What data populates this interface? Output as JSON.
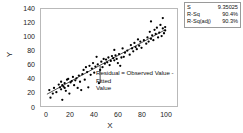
{
  "chart_data": {
    "type": "scatter",
    "title": "",
    "xlabel": "X",
    "ylabel": "Y",
    "xlim": [
      -5,
      110
    ],
    "ylim": [
      0,
      140
    ],
    "xticks": [
      0,
      20,
      40,
      60,
      80,
      100
    ],
    "yticks": [
      0,
      20,
      40,
      60,
      80,
      100,
      120,
      140
    ],
    "grid": false,
    "legend_position": "none",
    "series": [
      {
        "name": "Observed Values",
        "type": "scatter",
        "marker": "filled-circle",
        "color": "#000000",
        "points": [
          [
            2,
            23
          ],
          [
            3,
            12
          ],
          [
            5,
            18
          ],
          [
            6,
            26
          ],
          [
            8,
            20
          ],
          [
            10,
            31
          ],
          [
            11,
            27
          ],
          [
            12,
            24
          ],
          [
            12,
            35
          ],
          [
            13,
            30
          ],
          [
            13,
            9
          ],
          [
            14,
            28
          ],
          [
            15,
            33
          ],
          [
            15,
            26
          ],
          [
            16,
            22
          ],
          [
            17,
            38
          ],
          [
            18,
            39
          ],
          [
            18,
            29
          ],
          [
            19,
            18
          ],
          [
            20,
            34
          ],
          [
            21,
            36
          ],
          [
            22,
            42
          ],
          [
            23,
            30
          ],
          [
            24,
            37
          ],
          [
            25,
            40
          ],
          [
            26,
            26
          ],
          [
            27,
            44
          ],
          [
            28,
            35
          ],
          [
            29,
            23
          ],
          [
            30,
            46
          ],
          [
            31,
            52
          ],
          [
            32,
            38
          ],
          [
            33,
            56
          ],
          [
            34,
            49
          ],
          [
            35,
            27
          ],
          [
            36,
            58
          ],
          [
            37,
            45
          ],
          [
            38,
            54
          ],
          [
            39,
            62
          ],
          [
            40,
            48
          ],
          [
            41,
            57
          ],
          [
            42,
            71
          ],
          [
            43,
            60
          ],
          [
            44,
            33
          ],
          [
            45,
            52
          ],
          [
            46,
            64
          ],
          [
            47,
            56
          ],
          [
            48,
            68
          ],
          [
            49,
            61
          ],
          [
            50,
            67
          ],
          [
            51,
            63
          ],
          [
            52,
            70
          ],
          [
            53,
            59
          ],
          [
            54,
            65
          ],
          [
            55,
            72
          ],
          [
            56,
            69
          ],
          [
            57,
            66
          ],
          [
            57,
            81
          ],
          [
            58,
            73
          ],
          [
            59,
            68
          ],
          [
            60,
            62
          ],
          [
            61,
            75
          ],
          [
            62,
            58
          ],
          [
            63,
            70
          ],
          [
            64,
            83
          ],
          [
            65,
            71
          ],
          [
            66,
            77
          ],
          [
            68,
            80
          ],
          [
            70,
            74
          ],
          [
            71,
            88
          ],
          [
            72,
            83
          ],
          [
            73,
            79
          ],
          [
            74,
            91
          ],
          [
            75,
            85
          ],
          [
            76,
            82
          ],
          [
            77,
            96
          ],
          [
            78,
            87
          ],
          [
            79,
            93
          ],
          [
            80,
            84
          ],
          [
            82,
            95
          ],
          [
            84,
            90
          ],
          [
            85,
            99
          ],
          [
            86,
            93
          ],
          [
            87,
            107
          ],
          [
            88,
            97
          ],
          [
            88,
            122
          ],
          [
            89,
            102
          ],
          [
            90,
            95
          ],
          [
            91,
            110
          ],
          [
            92,
            104
          ],
          [
            93,
            113
          ],
          [
            94,
            99
          ],
          [
            95,
            106
          ],
          [
            96,
            117
          ],
          [
            97,
            101
          ],
          [
            98,
            112
          ],
          [
            98,
            127
          ],
          [
            99,
            105
          ],
          [
            100,
            114
          ],
          [
            100,
            109
          ]
        ]
      },
      {
        "name": "Fitted Regression Line",
        "type": "line",
        "color": "#000000",
        "endpoints": [
          [
            0,
            17
          ],
          [
            100,
            110
          ]
        ]
      }
    ],
    "annotations": [
      {
        "name": "residual-annotation",
        "text_line1": "Residual = Observed Value - Fitted",
        "text_line2": "Value",
        "marker": "vertical-segment",
        "segment_x": 45,
        "segment_y_top": 58,
        "segment_y_bottom": 33
      }
    ]
  },
  "stats": {
    "rows": [
      {
        "key": "S",
        "value": "9.35025"
      },
      {
        "key": "R-Sq",
        "value": "90.4%"
      },
      {
        "key": "R-Sq(adj)",
        "value": "90.3%"
      }
    ]
  }
}
